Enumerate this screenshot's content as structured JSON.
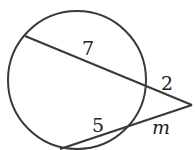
{
  "diagram": {
    "type": "secant-secant circle",
    "labels": {
      "top_inner": "7",
      "top_outer": "2",
      "bottom_inner": "5",
      "bottom_outer": "m"
    },
    "stroke_color": "#3a3a3a"
  }
}
